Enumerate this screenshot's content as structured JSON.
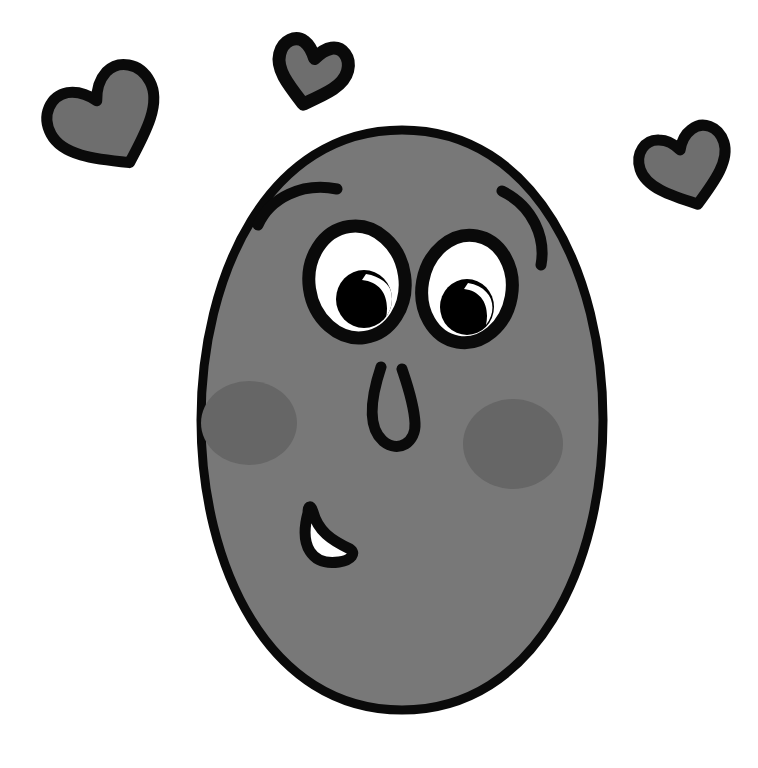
{
  "artwork": {
    "title": "Smiling Round Face With Hearts",
    "subject": "cartoon-face",
    "style": "hand-drawn-doodle",
    "background_color": "#FFFFFF",
    "canvas": {
      "width": 758,
      "height": 768
    }
  },
  "palette": {
    "outline": "#0A0A0A",
    "face_fill": "#787878",
    "blush_fill": "#666666",
    "eye_white": "#FFFFFF",
    "pupil": "#000000",
    "highlight": "#FFFFFF",
    "mouth_inner": "#FFFFFF",
    "heart_fill": "#6E6E6E",
    "background": "#FFFFFF"
  },
  "face": {
    "label": "Round face",
    "center": {
      "x": 402,
      "y": 420
    },
    "radius_x": 268,
    "radius_y": 290,
    "stroke_width": 9,
    "fill": "#787878"
  },
  "features": [
    {
      "name": "left-eyebrow",
      "label": "Left eyebrow",
      "type": "arc",
      "stroke_width": 11,
      "path": "M 258 223 C 272 196 304 183 336 190"
    },
    {
      "name": "right-eyebrow",
      "label": "Right eyebrow",
      "type": "arc",
      "stroke_width": 11,
      "path": "M 503 192 C 532 205 544 238 541 263"
    },
    {
      "name": "left-eye",
      "label": "Left eye",
      "type": "eye",
      "center": {
        "x": 357,
        "y": 282
      },
      "radius_x": 48,
      "radius_y": 56,
      "rotation": -8,
      "stroke_width": 13,
      "pupil": {
        "cx": 364,
        "cy": 299,
        "rx": 28,
        "ry": 29
      },
      "highlight": {
        "cx": 376,
        "cy": 288,
        "rx": 12,
        "ry": 15,
        "rotation": 35
      }
    },
    {
      "name": "right-eye",
      "label": "Right eye",
      "type": "eye",
      "center": {
        "x": 467,
        "y": 289
      },
      "radius_x": 45,
      "radius_y": 54,
      "rotation": 10,
      "stroke_width": 13,
      "pupil": {
        "cx": 467,
        "cy": 307,
        "rx": 27,
        "ry": 28
      },
      "highlight": {
        "cx": 478,
        "cy": 296,
        "rx": 11,
        "ry": 14,
        "rotation": 35
      }
    },
    {
      "name": "nose",
      "label": "Nose",
      "type": "stroke-path",
      "stroke_width": 11,
      "path": "M 380 366 C 372 392 368 424 384 440 C 398 452 414 442 414 424 C 414 404 406 382 402 368"
    },
    {
      "name": "mouth",
      "label": "Smiling mouth",
      "type": "filled-path",
      "stroke_width": 11,
      "inner_fill": "#FFFFFF",
      "path": "M 306 512 C 300 556 330 566 356 552 C 338 548 318 534 312 510 Z"
    },
    {
      "name": "left-blush",
      "label": "Left cheek blush",
      "type": "ellipse",
      "center": {
        "x": 249,
        "y": 423
      },
      "radius_x": 48,
      "radius_y": 42,
      "fill": "#666666"
    },
    {
      "name": "right-blush",
      "label": "Right cheek blush",
      "type": "ellipse",
      "center": {
        "x": 513,
        "y": 444
      },
      "radius_x": 50,
      "radius_y": 45,
      "fill": "#666666"
    }
  ],
  "hearts": [
    {
      "name": "heart-large-left",
      "label": "Large tilted heart, upper left",
      "center": {
        "x": 108,
        "y": 122
      },
      "size": 110,
      "rotation": -28,
      "stroke_width": 11,
      "fill": "#6E6E6E"
    },
    {
      "name": "heart-small-top",
      "label": "Small heart, top center",
      "center": {
        "x": 311,
        "y": 73
      },
      "size": 62,
      "rotation": 14,
      "stroke_width": 13,
      "fill": "#6E6E6E"
    },
    {
      "name": "heart-right",
      "label": "Heart, upper right",
      "center": {
        "x": 686,
        "y": 168
      },
      "size": 76,
      "rotation": -18,
      "stroke_width": 11,
      "fill": "#6E6E6E"
    }
  ],
  "accessibility": {
    "alt_text": "A grey hand-drawn round cartoon face with big eyes, rosy cheeks, a small U-shaped nose and a crescent smile, surrounded by three doodled hearts."
  }
}
